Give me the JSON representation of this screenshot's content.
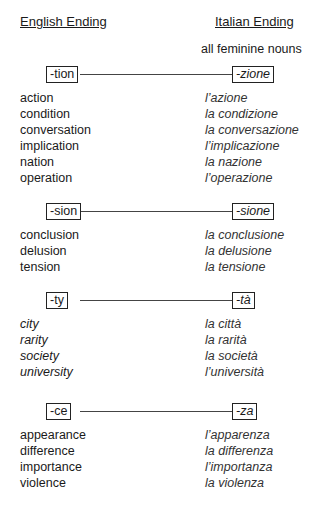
{
  "headers": {
    "english": "English Ending",
    "italian": "Italian Ending"
  },
  "subtitle": "all feminine nouns",
  "sections": [
    {
      "en_ending": "-tion",
      "it_ending": "-zione",
      "pairs": [
        {
          "en": "action",
          "it": "l’azione"
        },
        {
          "en": "condition",
          "it": "la condizione"
        },
        {
          "en": "conversation",
          "it": "la conversazione"
        },
        {
          "en": "implication",
          "it": "l’implicazione"
        },
        {
          "en": "nation",
          "it": "la nazione"
        },
        {
          "en": "operation",
          "it": "l’operazione"
        }
      ]
    },
    {
      "en_ending": "-sion",
      "it_ending": "-sione",
      "pairs": [
        {
          "en": "conclusion",
          "it": "la conclusione"
        },
        {
          "en": "delusion",
          "it": "la delusione"
        },
        {
          "en": "tension",
          "it": "la tensione"
        }
      ]
    },
    {
      "en_ending": "-ty",
      "it_ending": "-tà",
      "pairs": [
        {
          "en": "city",
          "it": "la città"
        },
        {
          "en": "rarity",
          "it": "la rarità"
        },
        {
          "en": "society",
          "it": "la società"
        },
        {
          "en": "university",
          "it": "l’università"
        }
      ]
    },
    {
      "en_ending": "-ce",
      "it_ending": "-za",
      "pairs": [
        {
          "en": "appearance",
          "it": "l’apparenza"
        },
        {
          "en": "difference",
          "it": "la differenza"
        },
        {
          "en": "importance",
          "it": "l’importanza"
        },
        {
          "en": "violence",
          "it": "la violenza"
        }
      ]
    }
  ]
}
